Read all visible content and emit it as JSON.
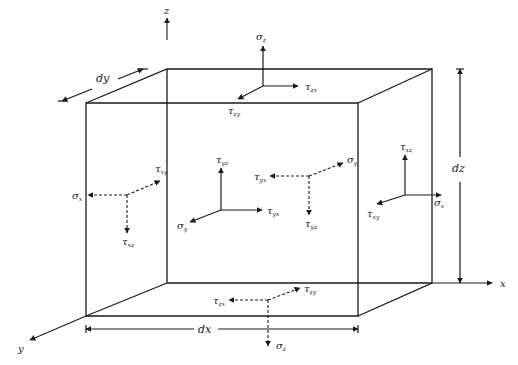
{
  "figure": {
    "axes": [
      {
        "name": "z",
        "label": "z",
        "from": [
          167,
          40
        ],
        "to": [
          167,
          18
        ],
        "label_pos": [
          164,
          14
        ]
      },
      {
        "name": "x",
        "label": "x",
        "from": [
          432,
          283
        ],
        "to": [
          492,
          283
        ],
        "label_pos": [
          500,
          287
        ]
      },
      {
        "name": "y",
        "label": "y",
        "from": [
          86,
          316
        ],
        "to": [
          30,
          340
        ],
        "label_pos": [
          18,
          352
        ]
      }
    ],
    "cube": {
      "front_face": [
        [
          86,
          103
        ],
        [
          358,
          103
        ],
        [
          358,
          316
        ],
        [
          86,
          316
        ]
      ],
      "back_face": [
        [
          167,
          69
        ],
        [
          432,
          69
        ],
        [
          432,
          283
        ],
        [
          167,
          283
        ]
      ],
      "hidden_edges": [
        [
          [
            167,
            69
          ],
          [
            167,
            283
          ]
        ],
        [
          [
            86,
            316
          ],
          [
            167,
            283
          ]
        ],
        [
          [
            167,
            283
          ],
          [
            432,
            283
          ]
        ]
      ]
    },
    "dimensions": [
      {
        "name": "dx",
        "label": "dx",
        "from": [
          86,
          329
        ],
        "to": [
          358,
          329
        ],
        "label_pos": [
          198,
          333
        ]
      },
      {
        "name": "dy",
        "label": "dy",
        "from": [
          143,
          69
        ],
        "to": [
          62,
          101
        ],
        "label_pos": [
          96,
          82
        ]
      },
      {
        "name": "dz",
        "label": "dz",
        "from": [
          460,
          69
        ],
        "to": [
          460,
          283
        ],
        "label_pos": [
          452,
          172
        ]
      }
    ],
    "stress_groups": [
      {
        "name": "top-face",
        "origin": [
          263,
          86
        ],
        "style": "solid",
        "arrows": [
          {
            "to": [
              263,
              46
            ],
            "sym": "σ",
            "sub": "z",
            "label_pos": [
              256,
              40
            ]
          },
          {
            "to": [
              298,
              86
            ],
            "sym": "τ",
            "sub": "zx",
            "label_pos": [
              305,
              90
            ]
          },
          {
            "to": [
              238,
              99
            ],
            "sym": "τ",
            "sub": "zy",
            "label_pos": [
              228,
              114
            ]
          }
        ]
      },
      {
        "name": "left-face",
        "origin": [
          127,
          195
        ],
        "style": "dashed",
        "arrows": [
          {
            "to": [
              88,
              195
            ],
            "sym": "σ",
            "sub": "x",
            "label_pos": [
              72,
              199
            ]
          },
          {
            "to": [
              160,
              181
            ],
            "sym": "τ",
            "sub": "xy",
            "label_pos": [
              155,
              172
            ]
          },
          {
            "to": [
              127,
              233
            ],
            "sym": "τ",
            "sub": "xz",
            "label_pos": [
              122,
              245
            ]
          }
        ]
      },
      {
        "name": "front-face",
        "origin": [
          221,
          210
        ],
        "style": "solid",
        "arrows": [
          {
            "to": [
              221,
              168
            ],
            "sym": "τ",
            "sub": "yz",
            "label_pos": [
              216,
              163
            ]
          },
          {
            "to": [
              262,
              210
            ],
            "sym": "τ",
            "sub": "yx",
            "label_pos": [
              267,
              214
            ]
          },
          {
            "to": [
              190,
              222
            ],
            "sym": "σ",
            "sub": "y",
            "label_pos": [
              177,
              229
            ]
          }
        ]
      },
      {
        "name": "back-face",
        "origin": [
          309,
          176
        ],
        "style": "dashed",
        "arrows": [
          {
            "to": [
              270,
              176
            ],
            "sym": "τ",
            "sub": "yx",
            "label_pos": [
              254,
              180
            ]
          },
          {
            "to": [
              343,
              163
            ],
            "sym": "σ",
            "sub": "y",
            "label_pos": [
              347,
              163
            ]
          },
          {
            "to": [
              309,
              215
            ],
            "sym": "τ",
            "sub": "yz",
            "label_pos": [
              305,
              227
            ]
          }
        ]
      },
      {
        "name": "right-face",
        "origin": [
          405,
          195
        ],
        "style": "solid",
        "arrows": [
          {
            "to": [
              405,
              155
            ],
            "sym": "τ",
            "sub": "xz",
            "label_pos": [
              400,
              150
            ]
          },
          {
            "to": [
              441,
              195
            ],
            "sym": "σ",
            "sub": "x",
            "label_pos": [
              434,
              206
            ]
          },
          {
            "to": [
              377,
              204
            ],
            "sym": "τ",
            "sub": "xy",
            "label_pos": [
              367,
              217
            ]
          }
        ]
      },
      {
        "name": "bottom-face",
        "origin": [
          268,
          300
        ],
        "style": "dashed",
        "arrows": [
          {
            "to": [
              229,
              300
            ],
            "sym": "τ",
            "sub": "zx",
            "label_pos": [
              213,
              304
            ]
          },
          {
            "to": [
              300,
              288
            ],
            "sym": "τ",
            "sub": "zy",
            "label_pos": [
              304,
              292
            ]
          },
          {
            "to": [
              268,
              346
            ],
            "sym": "σ",
            "sub": "z",
            "label_pos": [
              276,
              349
            ]
          }
        ]
      }
    ]
  }
}
